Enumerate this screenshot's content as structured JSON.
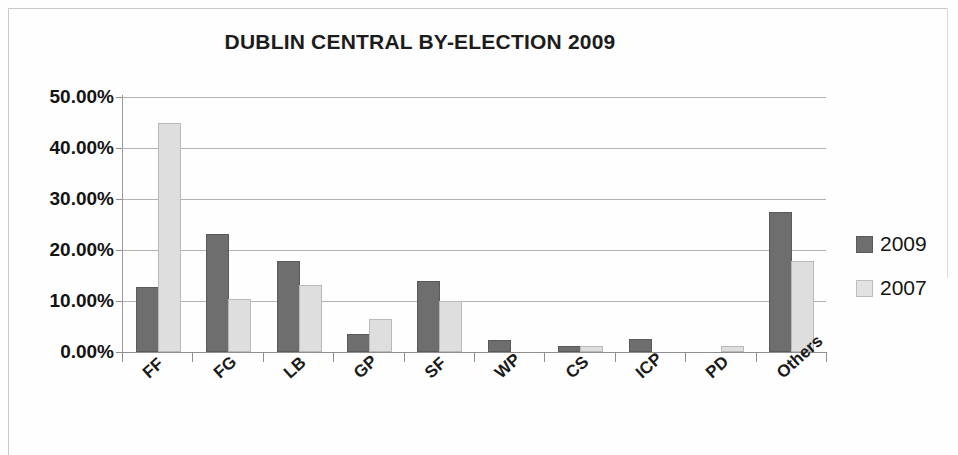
{
  "chart_data": {
    "type": "bar",
    "title": "DUBLIN CENTRAL BY-ELECTION 2009",
    "xlabel": "",
    "ylabel": "",
    "categories": [
      "FF",
      "FG",
      "LB",
      "GP",
      "SF",
      "WP",
      "CS",
      "ICP",
      "PD",
      "Others"
    ],
    "series": [
      {
        "name": "2009",
        "color": "#6e6e6e",
        "values": [
          12.3,
          22.8,
          17.5,
          3.1,
          13.5,
          2.0,
          0.7,
          2.2,
          0.0,
          27.0
        ]
      },
      {
        "name": "2007",
        "color": "#dedede",
        "values": [
          44.5,
          10.0,
          12.7,
          6.1,
          9.7,
          0.0,
          0.8,
          0.0,
          0.7,
          17.5
        ]
      }
    ],
    "ylim": [
      0,
      50
    ],
    "ytick_values": [
      0,
      10,
      20,
      30,
      40,
      50
    ],
    "ytick_labels": [
      "0.00%",
      "10.00%",
      "20.00%",
      "30.00%",
      "40.00%",
      "50.00%"
    ],
    "grid": true,
    "legend_position": "right",
    "legend_entries": [
      "2009",
      "2007"
    ]
  }
}
